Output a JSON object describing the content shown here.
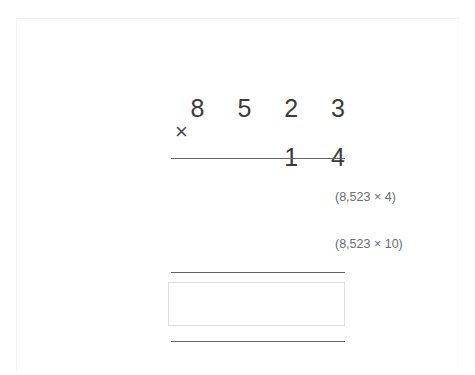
{
  "worksheet": {
    "page_border_color": "#f2f3f4",
    "background_color": "#ffffff"
  },
  "problem": {
    "type": "long-multiplication",
    "multiplicand": "8 5 2 3",
    "multiplicand_value": "8,523",
    "multiplier": "1 4",
    "multiplier_value": "14",
    "operator": "×",
    "text_color": "#3b3b3b",
    "rule_color": "#5f6368"
  },
  "partial_products": [
    {
      "label": "(8,523 × 4)",
      "name": "partial-product-ones"
    },
    {
      "label": "(8,523 × 10)",
      "name": "partial-product-tens"
    }
  ],
  "answer": {
    "value": "",
    "placeholder": "",
    "border_color": "#dcdddf"
  }
}
